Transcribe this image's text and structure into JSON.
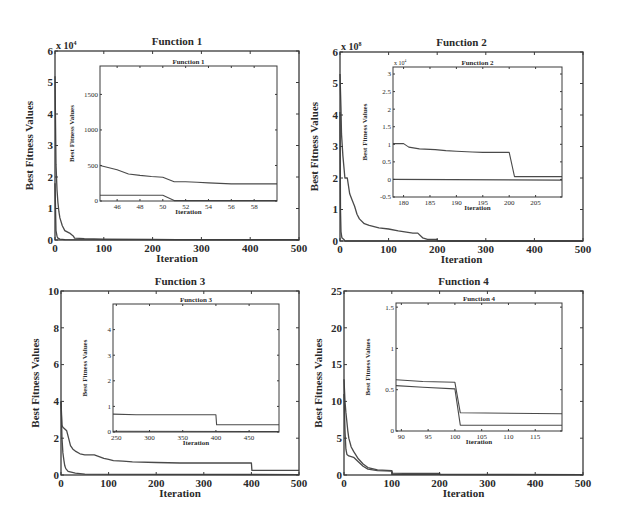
{
  "figure": {
    "background": "#ffffff",
    "line_color": "#4a4a4a",
    "axis_color": "#3a3a3a"
  },
  "chart_data": [
    {
      "type": "line",
      "title": "Function 1",
      "xlabel": "Iteration",
      "ylabel": "Best Fitness Values",
      "exponent_label": "x 10^4",
      "exp_base": "x 10",
      "exp_power": "4",
      "xlim": [
        0,
        500
      ],
      "ylim": [
        0,
        6
      ],
      "xticks": [
        0,
        100,
        200,
        300,
        400,
        500
      ],
      "yticks": [
        0,
        1,
        2,
        3,
        4,
        5,
        6
      ],
      "frame": {
        "left": 55,
        "top": 51,
        "right": 299,
        "bottom": 240
      },
      "series": [
        {
          "name": "curve A",
          "x": [
            0,
            2,
            4,
            6,
            8,
            10,
            15,
            20,
            30,
            38,
            40,
            60,
            100,
            200,
            250,
            300,
            400,
            500
          ],
          "y": [
            5.2,
            2.4,
            1.6,
            1.2,
            0.9,
            0.7,
            0.45,
            0.3,
            0.22,
            0.12,
            0.06,
            0.04,
            0.03,
            0.02,
            0.01,
            0.01,
            0.01,
            0.01
          ]
        },
        {
          "name": "curve B",
          "x": [
            0,
            2,
            4,
            6,
            10,
            20,
            500
          ],
          "y": [
            1.8,
            0.3,
            0.12,
            0.06,
            0.03,
            0.01,
            0.005
          ]
        }
      ],
      "inset": {
        "title": "Function 1",
        "xlabel": "Iteration",
        "ylabel": "Best Fitness Values",
        "xlim": [
          44.5,
          60
        ],
        "ylim": [
          0,
          1900
        ],
        "xticks": [
          46,
          48,
          50,
          52,
          54,
          56,
          58
        ],
        "yticks": [
          0,
          500,
          1000,
          1500
        ],
        "frame": {
          "left": 100,
          "top": 66,
          "right": 277,
          "bottom": 201
        },
        "series": [
          {
            "name": "curve A",
            "x": [
              44.5,
              46,
              47,
              48,
              49,
              50,
              51,
              52,
              53,
              54,
              55,
              56,
              58,
              60
            ],
            "y": [
              500,
              440,
              380,
              360,
              345,
              335,
              270,
              270,
              265,
              255,
              248,
              240,
              240,
              240
            ]
          },
          {
            "name": "curve B",
            "x": [
              44.5,
              50,
              51,
              60
            ],
            "y": [
              80,
              80,
              5,
              5
            ]
          }
        ]
      }
    },
    {
      "type": "line",
      "title": "Function 2",
      "xlabel": "Iteration",
      "ylabel": "Best Fitness Values",
      "exponent_label": "x 10^8",
      "exp_base": "x 10",
      "exp_power": "8",
      "xlim": [
        0,
        500
      ],
      "ylim": [
        0,
        6
      ],
      "xticks": [
        0,
        100,
        200,
        300,
        400,
        500
      ],
      "yticks": [
        0,
        1,
        2,
        3,
        4,
        5,
        6
      ],
      "frame": {
        "left": 340,
        "top": 52,
        "right": 583,
        "bottom": 241
      },
      "series": [
        {
          "name": "curve A",
          "x": [
            0,
            2,
            3,
            6,
            10,
            15,
            20,
            25,
            30,
            35,
            40,
            50,
            60,
            80,
            100,
            120,
            150,
            160,
            170,
            180,
            200,
            201,
            500
          ],
          "y": [
            5.3,
            4.2,
            3.4,
            2.7,
            2.0,
            2.0,
            1.5,
            1.3,
            1.1,
            0.85,
            0.7,
            0.55,
            0.5,
            0.42,
            0.38,
            0.32,
            0.25,
            0.25,
            0.1,
            0.05,
            0.05,
            0.0,
            0.0
          ]
        },
        {
          "name": "curve B",
          "x": [
            0,
            1,
            2,
            4,
            8,
            10,
            500
          ],
          "y": [
            4.1,
            1.0,
            0.3,
            0.1,
            0.05,
            0.0,
            0.0
          ]
        }
      ],
      "inset": {
        "title": "Function 2",
        "xlabel": "Iteration",
        "ylabel": "Best Fitness Values",
        "exponent_label": "x 10^4",
        "exp_base": "x 10",
        "exp_power": "4",
        "xlim": [
          178,
          210
        ],
        "ylim": [
          -0.5,
          3.2
        ],
        "xticks": [
          180,
          185,
          190,
          195,
          200,
          205
        ],
        "yticks": [
          -0.5,
          0,
          0.5,
          1,
          1.5,
          2,
          2.5,
          3
        ],
        "frame": {
          "left": 393,
          "top": 67,
          "right": 562,
          "bottom": 197
        },
        "series": [
          {
            "name": "curve A",
            "x": [
              178,
              180,
              181,
              183,
              186,
              188,
              190,
              193,
              195,
              200,
              201,
              210
            ],
            "y": [
              1.02,
              1.02,
              0.92,
              0.87,
              0.85,
              0.82,
              0.8,
              0.78,
              0.77,
              0.77,
              0.08,
              0.08
            ]
          },
          {
            "name": "curve B",
            "x": [
              178,
              210
            ],
            "y": [
              0.0,
              -0.02
            ]
          }
        ]
      }
    },
    {
      "type": "line",
      "title": "Function 3",
      "xlabel": "Iteration",
      "ylabel": "Best Fitness Values",
      "xlim": [
        0,
        500
      ],
      "ylim": [
        0,
        10
      ],
      "xticks": [
        0,
        100,
        200,
        300,
        400,
        500
      ],
      "yticks": [
        0,
        2,
        4,
        6,
        8,
        10
      ],
      "frame": {
        "left": 61,
        "top": 291,
        "right": 299,
        "bottom": 475
      },
      "series": [
        {
          "name": "curve A",
          "x": [
            0,
            2,
            4,
            8,
            12,
            16,
            20,
            25,
            30,
            40,
            50,
            70,
            80,
            90,
            100,
            110,
            130,
            150,
            200,
            250,
            300,
            350,
            400,
            401,
            500
          ],
          "y": [
            4.0,
            2.7,
            2.6,
            2.5,
            2.4,
            2.0,
            1.6,
            1.4,
            1.3,
            1.15,
            1.1,
            1.1,
            1.0,
            0.9,
            0.85,
            0.78,
            0.75,
            0.72,
            0.68,
            0.65,
            0.65,
            0.65,
            0.65,
            0.25,
            0.25
          ]
        },
        {
          "name": "curve B",
          "x": [
            0,
            2,
            4,
            6,
            8,
            10,
            15,
            30,
            50,
            500
          ],
          "y": [
            4.0,
            2.0,
            1.2,
            0.8,
            0.5,
            0.35,
            0.2,
            0.1,
            0.05,
            0.02
          ]
        }
      ],
      "inset": {
        "title": "Function 3",
        "xlabel": "Iteration",
        "ylabel": "Best Fitness Values",
        "xlim": [
          245,
          495
        ],
        "ylim": [
          0,
          5
        ],
        "xticks": [
          250,
          300,
          350,
          400,
          450
        ],
        "yticks": [
          0,
          1,
          2,
          3,
          4
        ],
        "frame": {
          "left": 113,
          "top": 304,
          "right": 279,
          "bottom": 432
        },
        "series": [
          {
            "name": "curve A",
            "x": [
              245,
              280,
              400,
              401,
              495
            ],
            "y": [
              0.7,
              0.67,
              0.67,
              0.28,
              0.28
            ]
          },
          {
            "name": "curve B",
            "x": [
              245,
              495
            ],
            "y": [
              0.03,
              0.02
            ]
          }
        ]
      }
    },
    {
      "type": "line",
      "title": "Function 4",
      "xlabel": "Iteration",
      "ylabel": "Best Fitness Values",
      "xlim": [
        0,
        500
      ],
      "ylim": [
        0,
        25
      ],
      "xticks": [
        0,
        100,
        200,
        300,
        400,
        500
      ],
      "yticks": [
        0,
        5,
        10,
        15,
        20,
        25
      ],
      "frame": {
        "left": 344,
        "top": 291,
        "right": 583,
        "bottom": 475
      },
      "series": [
        {
          "name": "curve A",
          "x": [
            0,
            2,
            4,
            6,
            8,
            10,
            15,
            20,
            30,
            40,
            50,
            70,
            100,
            101,
            150,
            200,
            201,
            500
          ],
          "y": [
            13,
            10,
            8.5,
            7.2,
            6.0,
            5.0,
            3.8,
            3.2,
            2.2,
            1.5,
            1.0,
            0.7,
            0.6,
            0.25,
            0.2,
            0.2,
            0.07,
            0.05
          ]
        },
        {
          "name": "curve B",
          "x": [
            0,
            2,
            4,
            6,
            10,
            20,
            30,
            40,
            50,
            70,
            100,
            101,
            200,
            500
          ],
          "y": [
            11,
            6,
            3.5,
            2.8,
            2.6,
            2.4,
            1.8,
            1.2,
            0.8,
            0.6,
            0.55,
            0.1,
            0.08,
            0.05
          ]
        }
      ],
      "inset": {
        "title": "Function 4",
        "xlabel": "Iteration",
        "ylabel": "Best Fitness Values",
        "xlim": [
          89,
          120
        ],
        "ylim": [
          0,
          1.55
        ],
        "xticks": [
          90,
          95,
          100,
          105,
          110,
          115
        ],
        "ytick_values": [
          0,
          0.5,
          1,
          1.5
        ],
        "yticks": [
          0,
          0.5,
          1,
          1.5
        ],
        "frame": {
          "left": 396,
          "top": 303,
          "right": 562,
          "bottom": 431
        },
        "series": [
          {
            "name": "curve A",
            "x": [
              89,
              94,
              100,
              101,
              120
            ],
            "y": [
              0.62,
              0.6,
              0.59,
              0.22,
              0.21
            ]
          },
          {
            "name": "curve B",
            "x": [
              89,
              94,
              100,
              101,
              120
            ],
            "y": [
              0.55,
              0.53,
              0.51,
              0.07,
              0.07
            ]
          }
        ]
      }
    }
  ]
}
